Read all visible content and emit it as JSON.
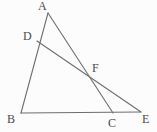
{
  "figure": {
    "kind": "geometry-diagram",
    "width": 157,
    "height": 132,
    "background_color": "#fcfcfc",
    "stroke_color": "#6e6e6e",
    "label_color": "#4a4a4a",
    "stroke_width": 1.1,
    "points": [
      {
        "id": "A",
        "label": "A",
        "x": 48,
        "y": 13,
        "label_x": 38,
        "label_y": 0
      },
      {
        "id": "D",
        "label": "D",
        "x": 37,
        "y": 41,
        "label_x": 23,
        "label_y": 30
      },
      {
        "id": "F",
        "label": "F",
        "x": 92,
        "y": 79,
        "label_x": 92,
        "label_y": 62
      },
      {
        "id": "B",
        "label": "B",
        "x": 21,
        "y": 113,
        "label_x": 7,
        "label_y": 113
      },
      {
        "id": "C",
        "label": "C",
        "x": 113,
        "y": 113,
        "label_x": 108,
        "label_y": 117
      },
      {
        "id": "E",
        "label": "E",
        "x": 141,
        "y": 112,
        "label_x": 142,
        "label_y": 113
      }
    ],
    "segments": [
      {
        "name": "segment-A-B",
        "from": "A",
        "to": "B"
      },
      {
        "name": "segment-A-C",
        "from": "A",
        "to": "C"
      },
      {
        "name": "segment-D-E",
        "from": "D",
        "to": "E"
      },
      {
        "name": "segment-B-E",
        "from": "B",
        "to": "E"
      }
    ]
  }
}
